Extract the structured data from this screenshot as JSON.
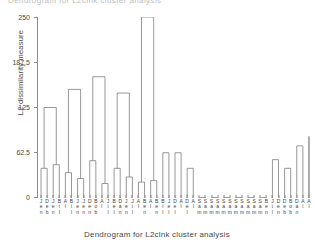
{
  "top_clipped_text": "Dendrogram for L2clnk cluster analysis",
  "axes": {
    "ylabel": "L2 dissimilarity measure",
    "xlabel": "Dendrogram for L2clnk cluster analysis",
    "yticks": [
      "0",
      "62.5",
      "125",
      "187.5",
      "250"
    ]
  },
  "chart_data": {
    "type": "dendrogram",
    "title": "Dendrogram for L2clnk cluster analysis",
    "xlabel": "Dendrogram for L2clnk cluster analysis",
    "ylabel": "L2 dissimilarity measure",
    "ylim": [
      0,
      250
    ],
    "ytick_values": [
      0,
      62.5,
      125,
      187.5,
      250
    ],
    "ytick_labels": [
      "0",
      "62.5",
      "125",
      "187.5",
      "250"
    ],
    "grid": false,
    "legend": "none",
    "linkage": "complete",
    "distance_metric": "L2",
    "n_leaves": 45,
    "leaf_labels": [
      "Jen",
      "Deb",
      "Jen",
      "Bil",
      "Al",
      "Bil",
      "Jen",
      "Jen",
      "Den",
      "Bob",
      "Al",
      "Jil",
      "Bel",
      "Dan",
      "Jen",
      "Jil",
      "Al",
      "Ben",
      "Al",
      "Ben",
      "Bil",
      "Jel",
      "Del",
      "Al",
      "Del",
      "Al",
      "Sam",
      "Sam",
      "Sam",
      "Sam",
      "Sam",
      "Sam",
      "Sam",
      "Sam",
      "Sam",
      "Sam",
      "Sam",
      "Ben",
      "Jil",
      "Den",
      "Deb",
      "Bob",
      "Dan",
      "Al",
      "Al"
    ],
    "leaf_labels_stacked": [
      [
        "J",
        "e",
        "n"
      ],
      [
        "D",
        "e",
        "b"
      ],
      [
        "J",
        "e",
        "n"
      ],
      [
        "B",
        "i",
        "l"
      ],
      [
        "A",
        "l",
        ""
      ],
      [
        "B",
        "i",
        "l"
      ],
      [
        "J",
        "e",
        "n"
      ],
      [
        "J",
        "e",
        "n"
      ],
      [
        "D",
        "e",
        "n"
      ],
      [
        "B",
        "o",
        "b"
      ],
      [
        "A",
        "l",
        ""
      ],
      [
        "J",
        "i",
        "l"
      ],
      [
        "B",
        "e",
        "l"
      ],
      [
        "D",
        "a",
        "n"
      ],
      [
        "J",
        "e",
        "n"
      ],
      [
        "J",
        "i",
        "l"
      ],
      [
        "A",
        "l",
        ""
      ],
      [
        "B",
        "e",
        "n"
      ],
      [
        "A",
        "l",
        ""
      ],
      [
        "B",
        "e",
        "n"
      ],
      [
        "B",
        "i",
        "l"
      ],
      [
        "J",
        "e",
        "l"
      ],
      [
        "D",
        "e",
        "l"
      ],
      [
        "A",
        "l",
        ""
      ],
      [
        "D",
        "e",
        "l"
      ],
      [
        "A",
        "l",
        ""
      ],
      [
        "S",
        "a",
        "m"
      ],
      [
        "S",
        "a",
        "m"
      ],
      [
        "S",
        "a",
        "m"
      ],
      [
        "S",
        "a",
        "m"
      ],
      [
        "S",
        "a",
        "m"
      ],
      [
        "S",
        "a",
        "m"
      ],
      [
        "S",
        "a",
        "m"
      ],
      [
        "S",
        "a",
        "m"
      ],
      [
        "S",
        "a",
        "m"
      ],
      [
        "S",
        "a",
        "m"
      ],
      [
        "S",
        "a",
        "m"
      ],
      [
        "B",
        "e",
        "n"
      ],
      [
        "J",
        "i",
        "l"
      ],
      [
        "D",
        "e",
        "n"
      ],
      [
        "D",
        "e",
        "b"
      ],
      [
        "B",
        "o",
        "b"
      ],
      [
        "D",
        "a",
        "n"
      ],
      [
        "A",
        "l",
        ""
      ],
      [
        "A",
        "l",
        ""
      ]
    ],
    "merges": [
      {
        "left": 0,
        "right": 1,
        "height": 41.0
      },
      {
        "left": 2,
        "right": 3,
        "height": 46.0
      },
      {
        "left": 4,
        "right": 5,
        "height": 35.0
      },
      {
        "left": 6,
        "right": 7,
        "height": 27.0
      },
      {
        "left": 8,
        "right": 9,
        "height": 51.5
      },
      {
        "left": 10,
        "right": 11,
        "height": 20.0
      },
      {
        "left": 12,
        "right": 13,
        "height": 41.0
      },
      {
        "left": 14,
        "right": 15,
        "height": 29.0
      },
      {
        "left": 16,
        "right": 17,
        "height": 22.0
      },
      {
        "left": 18,
        "right": 19,
        "height": 24.0
      },
      {
        "left": 20,
        "right": 21,
        "height": 62.5
      },
      {
        "left": 22,
        "right": 23,
        "height": 62.5
      },
      {
        "left": 24,
        "right": 25,
        "height": 41.0
      },
      {
        "left": 26,
        "right": 27,
        "height": 0.6
      },
      {
        "left": 28,
        "right": 29,
        "height": 0.6
      },
      {
        "left": 30,
        "right": 31,
        "height": 0.6
      },
      {
        "left": 32,
        "right": 33,
        "height": 0.6
      },
      {
        "left": 34,
        "right": 35,
        "height": 0.6
      },
      {
        "left": 36,
        "right": 37,
        "height": 0.6
      },
      {
        "left": 38,
        "right": 39,
        "height": 53.0
      },
      {
        "left": 40,
        "right": 41,
        "height": 41.0
      },
      {
        "left": 42,
        "right": 43,
        "height": 72.0
      },
      {
        "left": 44,
        "right": 44,
        "height": 85.0
      },
      {
        "left": 45,
        "right": 46,
        "height": 125.0
      },
      {
        "left": 47,
        "right": 48,
        "height": 150.0
      },
      {
        "left": 49,
        "right": 50,
        "height": 167.5
      },
      {
        "left": 51,
        "right": 52,
        "height": 145.0
      },
      {
        "left": 53,
        "right": 54,
        "height": 250.0
      }
    ],
    "cluster_heights_major": [
      250.0,
      167.5,
      150.0,
      145.0,
      125.0,
      105.0,
      85.0,
      72.0,
      62.5
    ]
  },
  "tree": {
    "root_height": 250.0,
    "left_branch_x": 113,
    "right_branch_x": 247
  }
}
